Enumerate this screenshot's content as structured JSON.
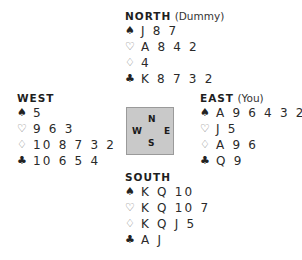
{
  "suits": {
    "spades": "♠",
    "hearts": "♡",
    "diamonds": "♢",
    "clubs": "♣"
  },
  "north": {
    "seat": "NORTH",
    "role": "(Dummy)",
    "spades": "J 8 7",
    "hearts": "A 8 4 2",
    "diamonds": "4",
    "clubs": "K 8 7 3 2"
  },
  "west": {
    "seat": "WEST",
    "role": "",
    "spades": "5",
    "hearts": "9 6 3",
    "diamonds": "10 8 7 3 2",
    "clubs": "10 6 5 4"
  },
  "east": {
    "seat": "EAST",
    "role": "(You)",
    "spades": "A 9 6 4 3 2",
    "hearts": "J 5",
    "diamonds": "A 9 6",
    "clubs": "Q 9"
  },
  "south": {
    "seat": "SOUTH",
    "role": "",
    "spades": "K Q 10",
    "hearts": "K Q 10 7",
    "diamonds": "K Q J 5",
    "clubs": "A J"
  },
  "compass": {
    "n": "N",
    "w": "W",
    "e": "E",
    "s": "S"
  }
}
